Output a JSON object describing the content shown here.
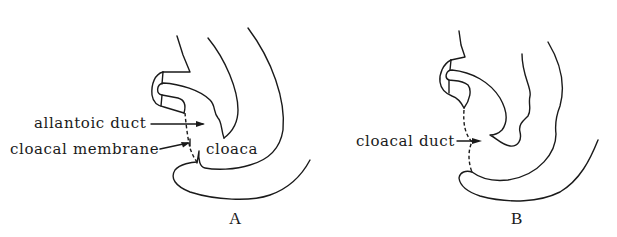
{
  "figure": {
    "panels": [
      {
        "id": "A",
        "label": "A",
        "annotations": [
          {
            "text": "allantoic duct"
          },
          {
            "text": "cloacal membrane"
          },
          {
            "text": "cloaca"
          }
        ]
      },
      {
        "id": "B",
        "label": "B",
        "annotations": [
          {
            "text": "cloacal duct"
          }
        ]
      }
    ],
    "colors": {
      "line": "#1a1a1a",
      "background": "#ffffff"
    }
  }
}
